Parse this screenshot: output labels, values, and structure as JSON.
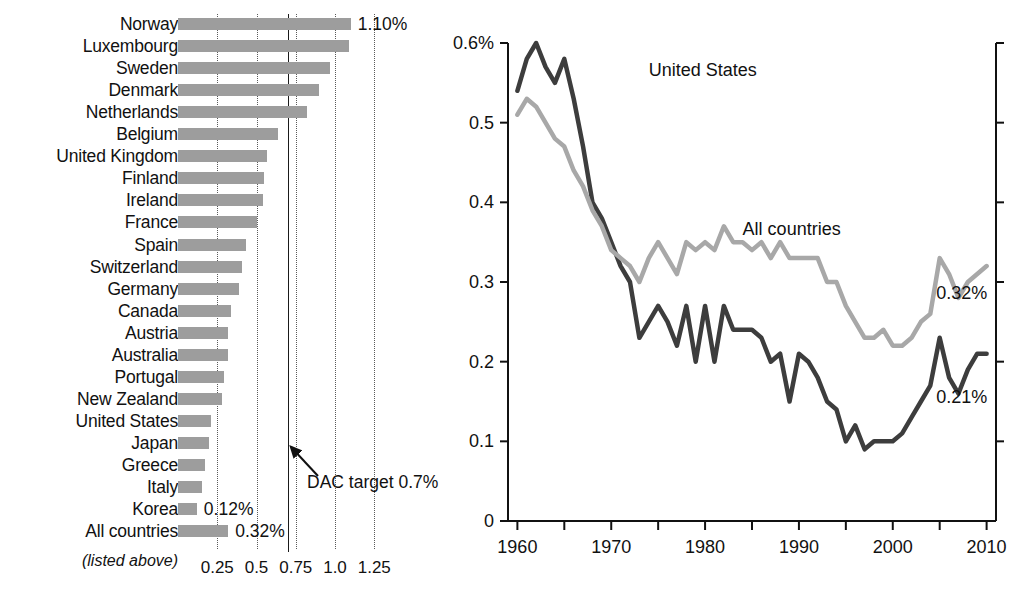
{
  "chart_data": [
    {
      "type": "bar",
      "orientation": "horizontal",
      "title": "",
      "xlabel": "",
      "ylabel": "",
      "xlim": [
        0,
        1.35
      ],
      "grid": true,
      "xticks": [
        "0.25",
        "0.5",
        "0.75",
        "1.0",
        "1.25"
      ],
      "xtick_values": [
        0.25,
        0.5,
        0.75,
        1.0,
        1.25
      ],
      "reference_line": {
        "value": 0.7,
        "label": "DAC target 0.7%",
        "style": "solid"
      },
      "footnote": "(listed above)",
      "categories": [
        "Norway",
        "Luxembourg",
        "Sweden",
        "Denmark",
        "Netherlands",
        "Belgium",
        "United Kingdom",
        "Finland",
        "Ireland",
        "France",
        "Spain",
        "Switzerland",
        "Germany",
        "Canada",
        "Austria",
        "Australia",
        "Portugal",
        "New Zealand",
        "United States",
        "Japan",
        "Greece",
        "Italy",
        "Korea",
        "All countries"
      ],
      "values": [
        1.1,
        1.09,
        0.97,
        0.9,
        0.82,
        0.64,
        0.57,
        0.55,
        0.54,
        0.5,
        0.43,
        0.41,
        0.39,
        0.34,
        0.32,
        0.32,
        0.29,
        0.28,
        0.21,
        0.2,
        0.17,
        0.15,
        0.12,
        0.32
      ],
      "value_labels": {
        "Norway": "1.10%",
        "Korea": "0.12%",
        "All countries": "0.32%"
      }
    },
    {
      "type": "line",
      "title": "",
      "xlabel": "",
      "ylabel": "",
      "xlim": [
        1957,
        2012
      ],
      "ylim": [
        0,
        0.62
      ],
      "grid": false,
      "yticks": [
        "0",
        "0.1",
        "0.2",
        "0.3",
        "0.4",
        "0.5",
        "0.6%"
      ],
      "ytick_values": [
        0,
        0.1,
        0.2,
        0.3,
        0.4,
        0.5,
        0.6
      ],
      "xticks": [
        "1960",
        "1970",
        "1980",
        "1990",
        "2000",
        "2010"
      ],
      "xtick_values": [
        1960,
        1970,
        1980,
        1990,
        2000,
        2010
      ],
      "x": [
        1960,
        1961,
        1962,
        1963,
        1964,
        1965,
        1966,
        1967,
        1968,
        1969,
        1970,
        1971,
        1972,
        1973,
        1974,
        1975,
        1976,
        1977,
        1978,
        1979,
        1980,
        1981,
        1982,
        1983,
        1984,
        1985,
        1986,
        1987,
        1988,
        1989,
        1990,
        1991,
        1992,
        1993,
        1994,
        1995,
        1996,
        1997,
        1998,
        1999,
        2000,
        2001,
        2002,
        2003,
        2004,
        2005,
        2006,
        2007,
        2008,
        2009,
        2010
      ],
      "series": [
        {
          "name": "United States",
          "color": "#3d3d3d",
          "end_label": "0.21%",
          "values": [
            0.54,
            0.58,
            0.6,
            0.57,
            0.55,
            0.58,
            0.53,
            0.47,
            0.4,
            0.38,
            0.35,
            0.32,
            0.3,
            0.23,
            0.25,
            0.27,
            0.25,
            0.22,
            0.27,
            0.2,
            0.27,
            0.2,
            0.27,
            0.24,
            0.24,
            0.24,
            0.23,
            0.2,
            0.21,
            0.15,
            0.21,
            0.2,
            0.18,
            0.15,
            0.14,
            0.1,
            0.12,
            0.09,
            0.1,
            0.1,
            0.1,
            0.11,
            0.13,
            0.15,
            0.17,
            0.23,
            0.18,
            0.16,
            0.19,
            0.21,
            0.21
          ]
        },
        {
          "name": "All countries",
          "color": "#a8a8a8",
          "end_label": "0.32%",
          "values": [
            0.51,
            0.53,
            0.52,
            0.5,
            0.48,
            0.47,
            0.44,
            0.42,
            0.39,
            0.37,
            0.34,
            0.33,
            0.32,
            0.3,
            0.33,
            0.35,
            0.33,
            0.31,
            0.35,
            0.34,
            0.35,
            0.34,
            0.37,
            0.35,
            0.35,
            0.34,
            0.35,
            0.33,
            0.35,
            0.33,
            0.33,
            0.33,
            0.33,
            0.3,
            0.3,
            0.27,
            0.25,
            0.23,
            0.23,
            0.24,
            0.22,
            0.22,
            0.23,
            0.25,
            0.26,
            0.33,
            0.31,
            0.28,
            0.3,
            0.31,
            0.32
          ]
        }
      ],
      "annotations": [
        {
          "text": "United States",
          "x": 1974,
          "y": 0.565
        },
        {
          "text": "All countries",
          "x": 1984,
          "y": 0.365
        }
      ]
    }
  ]
}
